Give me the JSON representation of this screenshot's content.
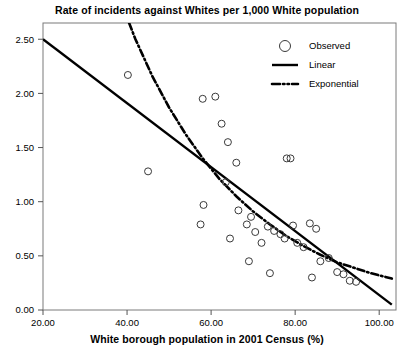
{
  "chart_data": {
    "type": "scatter",
    "title": "Rate of incidents against Whites per 1,000 White population",
    "xlabel": "White borough population in 2001 Census (%)",
    "ylabel": "",
    "xlim": [
      20,
      104
    ],
    "ylim": [
      0,
      2.65
    ],
    "xticks": [
      20,
      40,
      60,
      80,
      100
    ],
    "xtick_labels": [
      "20.00",
      "40.00",
      "60.00",
      "80.00",
      "100.00"
    ],
    "yticks": [
      0,
      0.5,
      1.0,
      1.5,
      2.0,
      2.5
    ],
    "ytick_labels": [
      "0.00",
      "0.50",
      "1.00",
      "1.50",
      "2.00",
      "2.50"
    ],
    "grid": false,
    "legend_position": "top-right",
    "legend": [
      {
        "label": "Observed",
        "marker": "open-circle"
      },
      {
        "label": "Linear",
        "marker": "solid-line"
      },
      {
        "label": "Exponential",
        "marker": "dash-dot-line"
      }
    ],
    "series": [
      {
        "name": "Observed",
        "marker": "open-circle",
        "points": [
          [
            40.2,
            2.17
          ],
          [
            45.0,
            1.28
          ],
          [
            58.0,
            1.95
          ],
          [
            61.0,
            1.97
          ],
          [
            62.5,
            1.72
          ],
          [
            64.0,
            1.55
          ],
          [
            66.0,
            1.36
          ],
          [
            58.2,
            0.97
          ],
          [
            57.5,
            0.79
          ],
          [
            63.5,
            1.18
          ],
          [
            64.5,
            0.66
          ],
          [
            66.5,
            0.92
          ],
          [
            68.5,
            0.79
          ],
          [
            69.5,
            0.86
          ],
          [
            70.5,
            0.72
          ],
          [
            72.0,
            0.62
          ],
          [
            73.5,
            0.77
          ],
          [
            75.0,
            0.73
          ],
          [
            76.5,
            0.7
          ],
          [
            77.5,
            0.66
          ],
          [
            78.0,
            1.4
          ],
          [
            78.9,
            1.4
          ],
          [
            79.5,
            0.78
          ],
          [
            80.5,
            0.62
          ],
          [
            82.0,
            0.58
          ],
          [
            83.5,
            0.8
          ],
          [
            85.0,
            0.75
          ],
          [
            86.0,
            0.45
          ],
          [
            88.0,
            0.48
          ],
          [
            90.0,
            0.35
          ],
          [
            91.5,
            0.33
          ],
          [
            93.0,
            0.27
          ],
          [
            94.5,
            0.26
          ],
          [
            74.0,
            0.34
          ],
          [
            69.0,
            0.45
          ],
          [
            84.0,
            0.3
          ]
        ]
      },
      {
        "name": "Linear",
        "style": "solid",
        "endpoints": [
          [
            20,
            2.5
          ],
          [
            103,
            0.05
          ]
        ]
      },
      {
        "name": "Exponential",
        "style": "dash-dot",
        "curve_points": [
          [
            38.0,
            2.9
          ],
          [
            42.0,
            2.5
          ],
          [
            46.0,
            2.16
          ],
          [
            50.0,
            1.87
          ],
          [
            54.0,
            1.62
          ],
          [
            58.0,
            1.4
          ],
          [
            62.0,
            1.21
          ],
          [
            66.0,
            1.05
          ],
          [
            70.0,
            0.91
          ],
          [
            74.0,
            0.79
          ],
          [
            78.0,
            0.68
          ],
          [
            82.0,
            0.59
          ],
          [
            86.0,
            0.51
          ],
          [
            90.0,
            0.44
          ],
          [
            94.0,
            0.39
          ],
          [
            98.0,
            0.34
          ],
          [
            103.0,
            0.29
          ]
        ]
      }
    ]
  }
}
